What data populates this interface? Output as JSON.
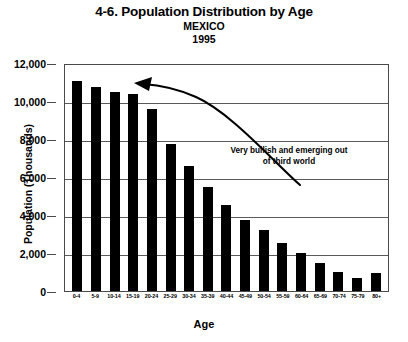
{
  "figure": {
    "title": "4-6. Population Distribution by Age",
    "subtitle": "MEXICO",
    "year": "1995"
  },
  "axes": {
    "xlabel": "Age",
    "ylabel": "Population (Thousands)",
    "ytick_labels": [
      "12,000",
      "10,000",
      "8,000",
      "6,000",
      "4,000",
      "2,000",
      "0"
    ]
  },
  "annotation": {
    "text": "Very bullish and emerging out of third world",
    "arrow": "curved-arrow-up-left"
  },
  "chart_data": {
    "type": "bar",
    "title": "4-6. Population Distribution by Age",
    "subtitle": "MEXICO 1995",
    "xlabel": "Age",
    "ylabel": "Population (Thousands)",
    "ylim": [
      0,
      12000
    ],
    "ytick_values": [
      0,
      2000,
      4000,
      6000,
      8000,
      10000,
      12000
    ],
    "grid": "horizontal",
    "legend": "none",
    "bar_color": "#000000",
    "categories": [
      "0-4",
      "5-9",
      "10-14",
      "15-19",
      "20-24",
      "25-29",
      "30-34",
      "35-39",
      "40-44",
      "45-49",
      "50-54",
      "55-59",
      "60-64",
      "65-69",
      "70-74",
      "75-79",
      "80+"
    ],
    "values": [
      11050,
      10750,
      10500,
      10350,
      9600,
      7750,
      6600,
      5500,
      4550,
      3750,
      3200,
      2550,
      2000,
      1500,
      1000,
      700,
      950
    ],
    "annotations": [
      {
        "text": "Very bullish and emerging out of third world",
        "x": "35-39",
        "y": 6800
      }
    ]
  }
}
